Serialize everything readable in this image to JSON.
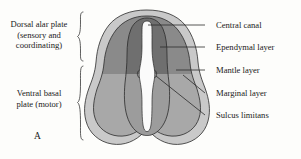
{
  "figure": {
    "panel_letter": "A",
    "background_color": "#fdfdfb",
    "line_color": "#2b2b2b"
  },
  "side_labels": {
    "dorsal": "Dorsal alar plate\n(sensory and\ncoordinating)",
    "ventral": "Ventral basal\nplate (motor)"
  },
  "callouts": [
    {
      "id": "central-canal",
      "label": "Central canal"
    },
    {
      "id": "ependymal-layer",
      "label": "Ependymal layer"
    },
    {
      "id": "mantle-layer",
      "label": "Mantle layer"
    },
    {
      "id": "marginal-layer",
      "label": "Marginal layer"
    },
    {
      "id": "sulcus-limitans",
      "label": "Sulcus limitans"
    }
  ],
  "structures": {
    "marginal_layer_color": "#c9c9c9",
    "mantle_dorsal_color": "#8a8a8a",
    "mantle_ventral_color": "#a8a8a8",
    "ependymal_dorsal_color": "#6f6f6f",
    "ependymal_ventral_color": "#9c9c9c",
    "central_canal_color": "#fbfbfb"
  }
}
